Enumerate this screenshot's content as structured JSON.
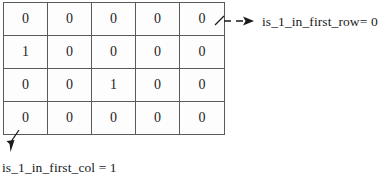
{
  "diagram": {
    "type": "matrix-annotation-diagram",
    "matrix": {
      "rows": 4,
      "cols": 5,
      "values": [
        [
          "0",
          "0",
          "0",
          "0",
          "0"
        ],
        [
          "1",
          "0",
          "0",
          "0",
          "0"
        ],
        [
          "0",
          "0",
          "1",
          "0",
          "0"
        ],
        [
          "0",
          "0",
          "0",
          "0",
          "0"
        ]
      ]
    },
    "annotations": {
      "first_row": {
        "label": "is_1_in_first_row= 0",
        "arrow": "dashed-arrow-right",
        "points_from": "row-1-last-cell"
      },
      "first_col": {
        "label": "is_1_in_first_col = 1",
        "arrow": "arrow-down-left",
        "points_from": "bottom-left-corner"
      }
    },
    "colors": {
      "grid_line": "#5a5a5a",
      "text": "#1a1a1a",
      "arrow": "#1a1a1a",
      "background": "#ffffff"
    }
  }
}
